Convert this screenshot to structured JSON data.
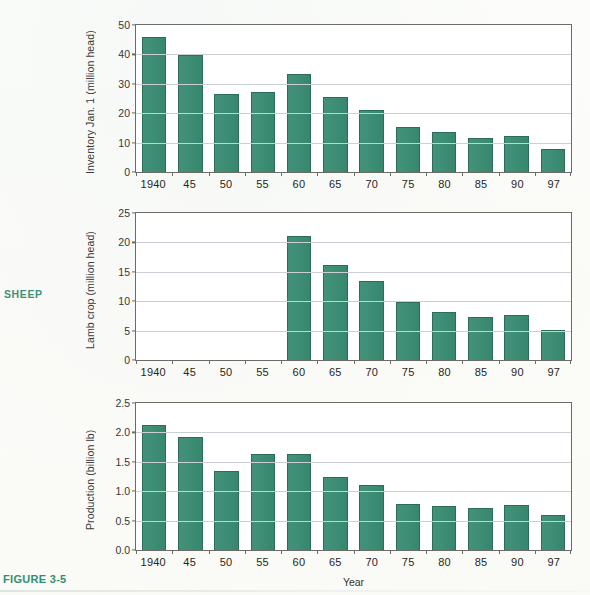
{
  "page": {
    "side_label": "SHEEP",
    "figure_label": "FIGURE 3-5",
    "accent_color": "#3f9179",
    "bar_color": "#3f8f77",
    "bar_border_color": "#2b6d59",
    "grid_color": "#c9cfd4",
    "axis_color": "#6b6b68"
  },
  "chart_data": [
    {
      "type": "bar",
      "id": "inventory",
      "title": "",
      "xlabel": "",
      "ylabel": "Inventory Jan. 1 (million head)",
      "ylim": [
        0,
        50
      ],
      "yticks": [
        0,
        10,
        20,
        30,
        40,
        50
      ],
      "ytick_labels": [
        "0",
        "10",
        "20",
        "30",
        "40",
        "50"
      ],
      "grid": true,
      "legend": "none",
      "categories": [
        "1940",
        "45",
        "50",
        "55",
        "60",
        "65",
        "70",
        "75",
        "80",
        "85",
        "90",
        "97"
      ],
      "values": [
        46.0,
        39.8,
        26.4,
        27.2,
        33.5,
        25.6,
        21.1,
        15.2,
        13.5,
        11.6,
        12.2,
        7.7
      ]
    },
    {
      "type": "bar",
      "id": "lamb-crop",
      "title": "",
      "xlabel": "",
      "ylabel": "Lamb crop (million head)",
      "ylim": [
        0,
        25
      ],
      "yticks": [
        0,
        5,
        10,
        15,
        20,
        25
      ],
      "ytick_labels": [
        "0",
        "5",
        "10",
        "15",
        "20",
        "25"
      ],
      "grid": true,
      "legend": "none",
      "categories": [
        "1940",
        "45",
        "50",
        "55",
        "60",
        "65",
        "70",
        "75",
        "80",
        "85",
        "90",
        "97"
      ],
      "values": [
        null,
        null,
        null,
        null,
        21.1,
        16.2,
        13.5,
        9.8,
        8.2,
        7.4,
        7.6,
        5.1
      ]
    },
    {
      "type": "bar",
      "id": "production",
      "title": "",
      "xlabel": "Year",
      "ylabel": "Production (billion lb)",
      "ylim": [
        0,
        2.5
      ],
      "yticks": [
        0,
        0.5,
        1.0,
        1.5,
        2.0,
        2.5
      ],
      "ytick_labels": [
        "0.0",
        "0.5",
        "1.0",
        "1.5",
        "2.0",
        "2.5"
      ],
      "grid": true,
      "legend": "none",
      "categories": [
        "1940",
        "45",
        "50",
        "55",
        "60",
        "65",
        "70",
        "75",
        "80",
        "85",
        "90",
        "97"
      ],
      "values": [
        2.12,
        1.93,
        1.35,
        1.63,
        1.64,
        1.24,
        1.11,
        0.79,
        0.75,
        0.72,
        0.77,
        0.6
      ]
    }
  ]
}
